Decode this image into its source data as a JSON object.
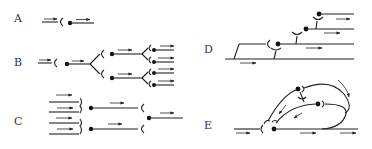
{
  "figure": {
    "panels": [
      {
        "id": "A",
        "label": "A",
        "name": "single-chain"
      },
      {
        "id": "B",
        "label": "B",
        "name": "divergence"
      },
      {
        "id": "C",
        "label": "C",
        "name": "convergence"
      },
      {
        "id": "D",
        "label": "D",
        "name": "parallel-after-discharge"
      },
      {
        "id": "E",
        "label": "E",
        "name": "reverberating-circuit"
      }
    ]
  }
}
